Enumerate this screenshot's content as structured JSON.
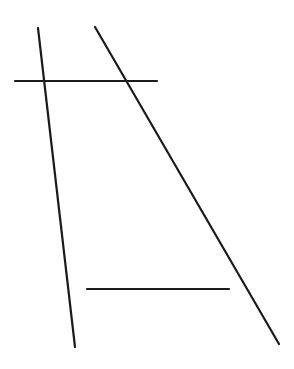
{
  "diagram": {
    "background": "#ffffff",
    "stroke_color": "#1a1a1a",
    "stroke_width": 2.2,
    "lines": [
      {
        "id": "left-slanted-line",
        "x1": 38,
        "y1": 28,
        "x2": 75,
        "y2": 347
      },
      {
        "id": "right-slanted-line",
        "x1": 95,
        "y1": 27,
        "x2": 279,
        "y2": 344
      },
      {
        "id": "top-horizontal-line",
        "x1": 15,
        "y1": 81,
        "x2": 157,
        "y2": 81
      },
      {
        "id": "bottom-horizontal-line",
        "x1": 87,
        "y1": 289,
        "x2": 229,
        "y2": 289
      }
    ]
  }
}
